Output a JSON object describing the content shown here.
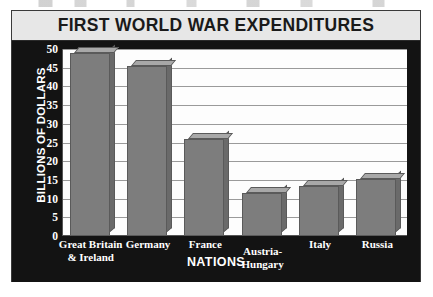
{
  "figure": {
    "title": "FIRST WORLD WAR EXPENDITURES",
    "x_axis_title": "NATIONS",
    "y_axis_title": "BILLIONS OF DOLLARS"
  },
  "colors": {
    "title_banner_bg": "#e7e7e7",
    "chart_body_bg": "#131313",
    "plot_bg": "#fdfdfd",
    "bar_front": "#7d7d7d",
    "bar_top": "#a8a8a8",
    "bar_side": "#6a6a6a",
    "gridline": "#9a9a9a",
    "label_text": "#ffffff",
    "title_text": "#1a1a1a"
  },
  "chart_data": {
    "type": "bar",
    "title": "FIRST WORLD WAR EXPENDITURES",
    "xlabel": "NATIONS",
    "ylabel": "BILLIONS OF DOLLARS",
    "categories": [
      "Great Britain & Ireland",
      "Germany",
      "France",
      "Austria-Hungary",
      "Italy",
      "Russia"
    ],
    "category_lines": [
      [
        "Great Britain",
        "& Ireland"
      ],
      [
        "Germany"
      ],
      [
        "France"
      ],
      [
        "Austria-",
        "Hungary"
      ],
      [
        "Italy"
      ],
      [
        "Russia"
      ]
    ],
    "values": [
      49,
      45.5,
      26,
      11.5,
      13.5,
      15.3
    ],
    "ylim": [
      0,
      50
    ],
    "ytick_step": 5,
    "yticks": [
      50,
      45,
      40,
      35,
      30,
      25,
      20,
      15,
      10,
      5,
      0
    ],
    "grid": true,
    "legend": false
  }
}
